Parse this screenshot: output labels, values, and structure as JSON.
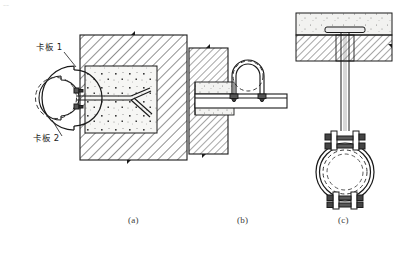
{
  "figure": {
    "title": "",
    "corner_mark": "––",
    "background": "#ffffff",
    "ink": "#1a1a1a"
  },
  "captions": [
    {
      "key": "a",
      "text": "(a)",
      "x": 128,
      "y": 222
    },
    {
      "key": "b",
      "text": "(b)",
      "x": 237,
      "y": 222
    },
    {
      "key": "c",
      "text": "(c)",
      "x": 338,
      "y": 222
    }
  ],
  "labels": [
    {
      "id": "ka-ban-1",
      "text": "卡板 1",
      "x": 36,
      "y": 47
    },
    {
      "id": "ka-ban-2",
      "text": "卡板 2",
      "x": 33,
      "y": 137
    }
  ],
  "panels": [
    {
      "key": "a",
      "name": "wall-embedded-clamp-detail",
      "description": "pipe clamp plates anchored by forked rod into concrete pocket in masonry wall",
      "parts": [
        "masonry-wall-block",
        "concrete-pocket-fill",
        "forked-anchor-rod",
        "clamp-plate-outer",
        "clamp-plate-inner",
        "pipe-dashed-circle",
        "bolt-pair"
      ]
    },
    {
      "key": "b",
      "name": "cantilever-bracket-detail",
      "description": "steel bracket built into wall carrying pipe held by U-bolt",
      "parts": [
        "masonry-wall-block",
        "bracket-embed-plates",
        "bracket-channel",
        "u-bolt",
        "pipe-dashed-circle",
        "nut-pair"
      ]
    },
    {
      "key": "c",
      "name": "ceiling-hanger-clamp-detail",
      "description": "pipe ring clamp suspended from slab by threaded hanger rod with embedded plate",
      "parts": [
        "floor-slab-screed",
        "slab-hatched-band",
        "embedded-plate",
        "hanger-rod",
        "clamp-ring",
        "pipe-dashed-circle",
        "upper-bolt-ears",
        "lower-bolt-ears"
      ]
    }
  ],
  "colors": {
    "line": "#1a1a1a",
    "hatch": "#333333",
    "stipple": "#555555",
    "fill_light": "#f4f4f4",
    "dash": "#444444"
  }
}
